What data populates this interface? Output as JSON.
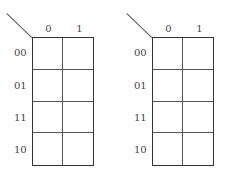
{
  "maps": [
    {
      "column_labels": [
        "0",
        "1"
      ],
      "row_labels": [
        "00",
        "01",
        "11",
        "10"
      ],
      "cells": [
        [
          "",
          ""
        ],
        [
          "",
          ""
        ],
        [
          "",
          ""
        ],
        [
          "",
          ""
        ]
      ]
    },
    {
      "column_labels": [
        "0",
        "1"
      ],
      "row_labels": [
        "00",
        "01",
        "11",
        "10"
      ],
      "cells": [
        [
          "",
          ""
        ],
        [
          "",
          ""
        ],
        [
          "",
          ""
        ],
        [
          "",
          ""
        ]
      ]
    }
  ]
}
